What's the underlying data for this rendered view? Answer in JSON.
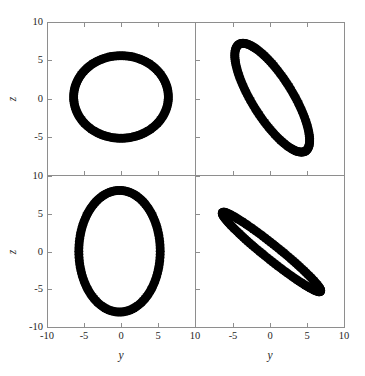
{
  "figure": {
    "background_color": "#ffffff",
    "marker_color": "#000000",
    "frame_color": "#8e8e8e",
    "width": 365,
    "height": 376,
    "rows": 2,
    "cols": 2
  },
  "axes": {
    "x_label": "y",
    "y_label": "z",
    "x_ticks": [
      "-10",
      "-5",
      "0",
      "5",
      "10"
    ],
    "y_ticks": [
      "10",
      "5",
      "0",
      "-5",
      "-10"
    ],
    "x_range": [
      -10,
      10
    ],
    "y_range": [
      -10,
      10
    ],
    "x_tick_values": [
      -10,
      -5,
      0,
      5,
      10
    ],
    "y_tick_values": [
      10,
      5,
      0,
      -5,
      -10
    ],
    "top_row_y_ticks": [
      "10",
      "5",
      "0",
      "-5"
    ],
    "bottom_row_y_ticks": [
      "10",
      "5",
      "0",
      "-5",
      "-10"
    ],
    "right_col_x_ticks": [
      "-5",
      "0",
      "5",
      "10"
    ]
  },
  "chart_data": {
    "type": "scatter",
    "title": "",
    "subtitle": "",
    "xlabel": "y",
    "ylabel": "z",
    "xlim": [
      -10,
      10
    ],
    "ylim": [
      -10,
      10
    ],
    "grid": false,
    "legend": null,
    "marker": {
      "shape": "circle",
      "size_px": 9,
      "color": "#000000",
      "count_per_panel": 120
    },
    "panels": [
      {
        "position": "top-left",
        "row": 0,
        "col": 0,
        "xlabel": "y",
        "ylabel": "z",
        "xlim": [
          -10,
          10
        ],
        "ylim": [
          -10,
          10
        ],
        "x_tick_labels": [],
        "y_tick_labels": [
          "10",
          "5",
          "0",
          "-5"
        ],
        "shape": "ellipse-ring",
        "description": "Wide upright elliptical ring, wider than tall",
        "ellipse": {
          "cx": 0.0,
          "cy": 0.2,
          "rx": 6.4,
          "ry": 5.4,
          "rotation_deg": 0,
          "ring_thickness": 1.6
        },
        "x_extent": [
          -6.4,
          6.4
        ],
        "y_extent": [
          -5.2,
          5.6
        ]
      },
      {
        "position": "top-right",
        "row": 0,
        "col": 1,
        "xlabel": "y",
        "ylabel": "z",
        "xlim": [
          -10,
          10
        ],
        "ylim": [
          -10,
          10
        ],
        "x_tick_labels": [],
        "y_tick_labels": [],
        "shape": "ellipse-ring-tilted",
        "description": "Narrow elliptical ring tilted about 57 degrees, long axis running lower-left to upper-right",
        "ellipse": {
          "cx": 0.3,
          "cy": 0.1,
          "rx": 8.3,
          "ry": 2.7,
          "rotation_deg": -57,
          "ring_thickness": 1.5
        },
        "x_extent": [
          -5.6,
          6.1
        ],
        "y_extent": [
          -7.4,
          7.2
        ]
      },
      {
        "position": "bottom-left",
        "row": 1,
        "col": 0,
        "xlabel": "y",
        "ylabel": "z",
        "xlim": [
          -10,
          10
        ],
        "ylim": [
          -10,
          10
        ],
        "x_tick_labels": [
          "-10",
          "-5",
          "0",
          "5",
          "10"
        ],
        "y_tick_labels": [
          "10",
          "5",
          "0",
          "-5",
          "-10"
        ],
        "shape": "ellipse-ring",
        "description": "Tall upright elliptical ring, taller than wide",
        "ellipse": {
          "cx": -0.2,
          "cy": 0.1,
          "rx": 5.5,
          "ry": 8.0,
          "rotation_deg": 0,
          "ring_thickness": 1.6
        },
        "x_extent": [
          -5.8,
          5.4
        ],
        "y_extent": [
          -8.0,
          8.2
        ]
      },
      {
        "position": "bottom-right",
        "row": 1,
        "col": 1,
        "xlabel": "y",
        "ylabel": "z",
        "xlim": [
          -10,
          10
        ],
        "ylim": [
          -10,
          10
        ],
        "x_tick_labels": [
          "-5",
          "0",
          "5",
          "10"
        ],
        "y_tick_labels": [],
        "shape": "ellipse-degenerate",
        "description": "Nearly collapsed solid ellipse forming a thick diagonal streak with positive slope",
        "ellipse": {
          "cx": 0.2,
          "cy": 0.0,
          "rx": 8.4,
          "ry": 0.95,
          "rotation_deg": -38,
          "ring_thickness": 2.2
        },
        "x_extent": [
          -6.6,
          6.7
        ],
        "y_extent": [
          -5.2,
          5.2
        ]
      }
    ]
  }
}
